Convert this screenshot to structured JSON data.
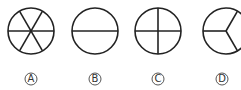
{
  "figure": {
    "stroke_color": "#222222",
    "options": [
      {
        "label": "A",
        "circle": "circle divided into 6 sectors by 3 diameters"
      },
      {
        "label": "B",
        "circle": "circle divided into 2 halves by horizontal diameter"
      },
      {
        "label": "C",
        "circle": "circle divided into 4 quarters by cross"
      },
      {
        "label": "D",
        "circle": "circle divided into 3 sectors by 3 radii"
      }
    ]
  }
}
